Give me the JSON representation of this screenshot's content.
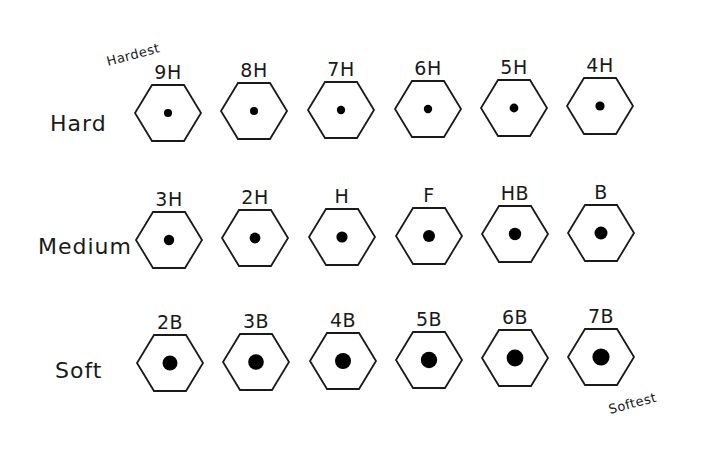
{
  "annotations": {
    "hardest": "Hardest",
    "softest": "Softest"
  },
  "rows": [
    {
      "label": "Hard",
      "label_pos": [
        50,
        131
      ],
      "grades": [
        {
          "name": "9H",
          "cx": 168,
          "cy": 113,
          "dot_r": 4
        },
        {
          "name": "8H",
          "cx": 254,
          "cy": 111,
          "dot_r": 4
        },
        {
          "name": "7H",
          "cx": 341,
          "cy": 110,
          "dot_r": 4.2
        },
        {
          "name": "6H",
          "cx": 428,
          "cy": 109,
          "dot_r": 4.2
        },
        {
          "name": "5H",
          "cx": 514,
          "cy": 108,
          "dot_r": 4.4
        },
        {
          "name": "4H",
          "cx": 600,
          "cy": 106,
          "dot_r": 4.6
        }
      ]
    },
    {
      "label": "Medium",
      "label_pos": [
        38,
        254
      ],
      "grades": [
        {
          "name": "3H",
          "cx": 169,
          "cy": 240,
          "dot_r": 5.2
        },
        {
          "name": "2H",
          "cx": 255,
          "cy": 238,
          "dot_r": 5.4
        },
        {
          "name": "H",
          "cx": 342,
          "cy": 237,
          "dot_r": 5.6
        },
        {
          "name": "F",
          "cx": 429,
          "cy": 236,
          "dot_r": 6
        },
        {
          "name": "HB",
          "cx": 515,
          "cy": 234,
          "dot_r": 6.2
        },
        {
          "name": "B",
          "cx": 601,
          "cy": 233,
          "dot_r": 6.5
        }
      ]
    },
    {
      "label": "Soft",
      "label_pos": [
        55,
        378
      ],
      "grades": [
        {
          "name": "2B",
          "cx": 170,
          "cy": 363,
          "dot_r": 7.5
        },
        {
          "name": "3B",
          "cx": 256,
          "cy": 362,
          "dot_r": 7.8
        },
        {
          "name": "4B",
          "cx": 343,
          "cy": 361,
          "dot_r": 8
        },
        {
          "name": "5B",
          "cx": 429,
          "cy": 360,
          "dot_r": 8.2
        },
        {
          "name": "6B",
          "cx": 515,
          "cy": 358,
          "dot_r": 8.4
        },
        {
          "name": "7B",
          "cx": 601,
          "cy": 357,
          "dot_r": 8.6
        }
      ]
    }
  ],
  "colors": {
    "background": "#ffffff",
    "ink": "#1a1a1a",
    "lead": "#000000"
  }
}
